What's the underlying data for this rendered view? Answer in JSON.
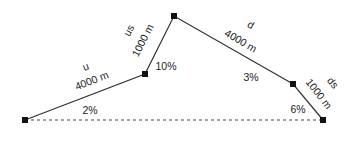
{
  "diagram": {
    "type": "road-profile",
    "nodes": [
      {
        "id": "start",
        "x": 25,
        "y": 120
      },
      {
        "id": "n1",
        "x": 145,
        "y": 74
      },
      {
        "id": "peak",
        "x": 174,
        "y": 16
      },
      {
        "id": "n3",
        "x": 293,
        "y": 84
      },
      {
        "id": "end",
        "x": 323,
        "y": 120
      }
    ],
    "segments": [
      {
        "name": "u",
        "length": "4000 m",
        "grade": "2%"
      },
      {
        "name": "us",
        "length": "1000 m",
        "grade": "10%"
      },
      {
        "name": "d",
        "length": "4000 m",
        "grade": "3%"
      },
      {
        "name": "ds",
        "length": "1000 m",
        "grade": "6%"
      }
    ],
    "baseline": "dashed"
  }
}
